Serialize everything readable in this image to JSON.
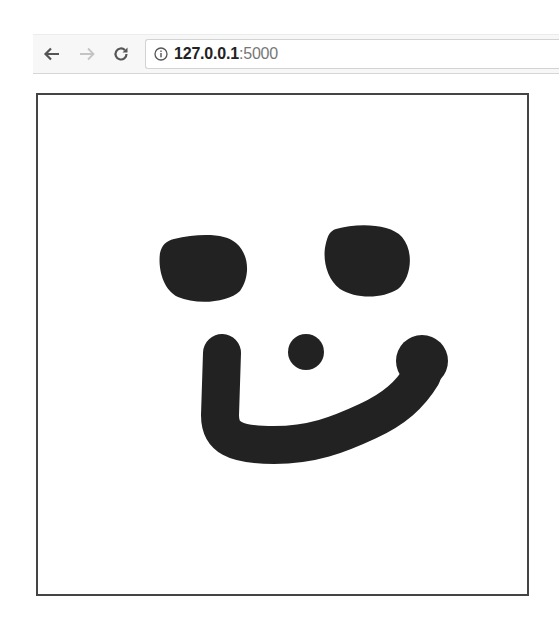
{
  "browser": {
    "back_label": "Back",
    "forward_label": "Forward",
    "reload_label": "Reload",
    "url": {
      "host": "127.0.0.1",
      "port_suffix": ":5000"
    }
  },
  "canvas": {
    "drawing": "smiley face",
    "stroke_color": "#222222",
    "background_color": "#ffffff",
    "marks": [
      {
        "name": "left-eye"
      },
      {
        "name": "right-eye"
      },
      {
        "name": "nose"
      },
      {
        "name": "mouth"
      }
    ]
  }
}
